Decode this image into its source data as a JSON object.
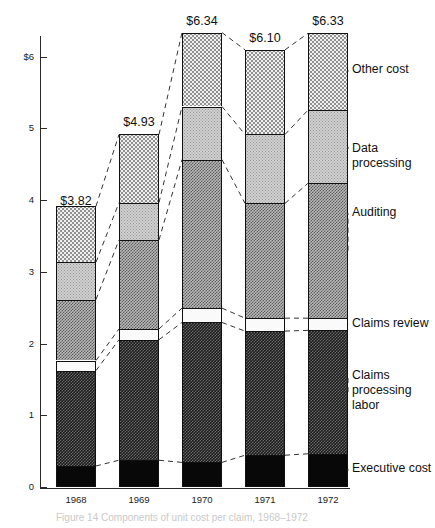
{
  "chart_data": {
    "type": "bar",
    "subtype": "stacked-bar",
    "title": "",
    "xlabel": "",
    "ylabel": "",
    "ylim": [
      0,
      6.6
    ],
    "yticks": [
      0,
      1,
      2,
      3,
      4,
      5,
      6
    ],
    "ytick_labels": [
      "0",
      "1",
      "2",
      "3",
      "4",
      "5",
      "$6"
    ],
    "grid": false,
    "legend_position": "right-inline",
    "categories": [
      "1968",
      "1969",
      "1970",
      "1971",
      "1972"
    ],
    "totals": [
      3.82,
      4.93,
      6.34,
      6.1,
      6.33
    ],
    "total_labels": [
      "$3.82",
      "$4.93",
      "$6.34",
      "$6.10",
      "$6.33"
    ],
    "series": [
      {
        "name": "Executive cost",
        "key": "exec",
        "values": [
          0.3,
          0.38,
          0.35,
          0.45,
          0.47
        ]
      },
      {
        "name": "Claims processing labor",
        "key": "labor",
        "values": [
          1.33,
          1.68,
          1.95,
          1.73,
          1.72
        ]
      },
      {
        "name": "Claims review",
        "key": "claims",
        "values": [
          0.14,
          0.15,
          0.2,
          0.18,
          0.17
        ]
      },
      {
        "name": "Auditing",
        "key": "audit",
        "values": [
          0.85,
          1.24,
          2.07,
          1.6,
          1.88
        ]
      },
      {
        "name": "Data processing",
        "key": "data",
        "values": [
          0.52,
          0.52,
          0.74,
          0.96,
          1.02
        ]
      },
      {
        "name": "Other cost",
        "key": "other",
        "values": [
          0.78,
          0.95,
          1.03,
          1.18,
          1.07
        ]
      }
    ]
  },
  "axis": {
    "ticks": [
      {
        "label": "$6",
        "value": 6
      },
      {
        "label": "5",
        "value": 5
      },
      {
        "label": "4",
        "value": 4
      },
      {
        "label": "3",
        "value": 3
      },
      {
        "label": "2",
        "value": 2
      },
      {
        "label": "1",
        "value": 1
      },
      {
        "label": "0",
        "value": 0
      }
    ]
  },
  "legend": {
    "items": [
      {
        "label": "Other cost",
        "y": 62
      },
      {
        "label": "Data processing",
        "y": 141
      },
      {
        "label": "Auditing",
        "y": 205
      },
      {
        "label": "Claims review",
        "y": 316
      },
      {
        "label": "Claims processing\nlabor",
        "y": 368
      },
      {
        "label": "Executive cost",
        "y": 461
      }
    ]
  },
  "bars": [
    {
      "year": "1968",
      "total_label": "$3.82"
    },
    {
      "year": "1969",
      "total_label": "$4.93"
    },
    {
      "year": "1970",
      "total_label": "$6.34"
    },
    {
      "year": "1971",
      "total_label": "$6.10"
    },
    {
      "year": "1972",
      "total_label": "$6.33"
    }
  ],
  "caption": "Figure 14  Components of unit cost per claim, 1968–1972"
}
